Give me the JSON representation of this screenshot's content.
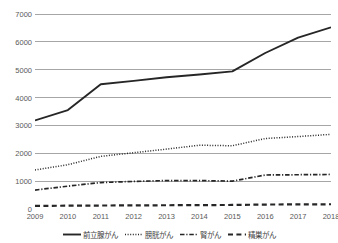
{
  "chart_data": {
    "type": "line",
    "title": "",
    "xlabel": "",
    "ylabel": "",
    "x": [
      "2009",
      "2010",
      "2011",
      "2012",
      "2013",
      "2014",
      "2015",
      "2016",
      "2017",
      "2018"
    ],
    "categories": [
      "2009",
      "2010",
      "2011",
      "2012",
      "2013",
      "2014",
      "2015",
      "2016",
      "2017",
      "2018"
    ],
    "ylim": [
      0,
      7000
    ],
    "y_ticks": [
      0,
      1000,
      2000,
      3000,
      4000,
      5000,
      6000,
      7000
    ],
    "y_tick_labels": [
      "0",
      "1000",
      "2000",
      "3000",
      "4000",
      "5000",
      "6000",
      "7000"
    ],
    "grid": true,
    "legend_position": "bottom",
    "series": [
      {
        "name": "前立腺がん",
        "style": "solid",
        "color": "#262626",
        "values": [
          3180,
          3550,
          4480,
          4600,
          4730,
          4830,
          4940,
          5600,
          6150,
          6520
        ]
      },
      {
        "name": "膀胱がん",
        "style": "dotted",
        "color": "#262626",
        "values": [
          1400,
          1590,
          1890,
          2020,
          2150,
          2290,
          2270,
          2530,
          2600,
          2680
        ]
      },
      {
        "name": "腎がん",
        "style": "dashdot",
        "color": "#262626",
        "values": [
          680,
          820,
          950,
          990,
          1020,
          1020,
          1000,
          1220,
          1230,
          1240
        ]
      },
      {
        "name": "精巣がん",
        "style": "dashed",
        "color": "#262626",
        "values": [
          110,
          120,
          125,
          130,
          135,
          140,
          145,
          160,
          165,
          170
        ]
      }
    ]
  },
  "axis": {
    "y_labels": [
      "7000",
      "6000",
      "5000",
      "4000",
      "3000",
      "2000",
      "1000",
      "0"
    ],
    "x_labels": [
      "2009",
      "2010",
      "2011",
      "2012",
      "2013",
      "2014",
      "2015",
      "2016",
      "2017",
      "2018"
    ]
  },
  "legend": {
    "items": [
      {
        "label": "前立腺がん",
        "style": "solid"
      },
      {
        "label": "膀胱がん",
        "style": "dotted"
      },
      {
        "label": "腎がん",
        "style": "dashdot"
      },
      {
        "label": "精巣がん",
        "style": "dashed"
      }
    ]
  },
  "colors": {
    "line": "#262626",
    "grid": "#a6a6a6",
    "tick_text": "#595959",
    "background": "#ffffff"
  }
}
